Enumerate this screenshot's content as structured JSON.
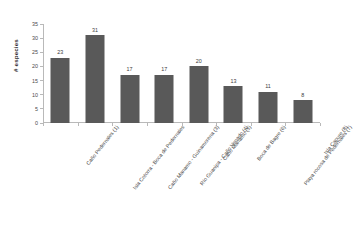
{
  "chart_data": {
    "type": "bar",
    "title": "",
    "subtitle": "",
    "xlabel": "",
    "ylabel": "# especies",
    "ylim": [
      0,
      35
    ],
    "ytick_values": [
      0,
      5,
      10,
      15,
      20,
      25,
      30,
      35
    ],
    "ytick_labels": [
      "0",
      "5",
      "10",
      "15",
      "20",
      "25",
      "30",
      "35"
    ],
    "grid": false,
    "legend": null,
    "bar_color": "#595959",
    "axis_color": "#b9b9b9",
    "data_labels_shown": true,
    "categories": [
      "Caño Pedernales (1)",
      "Isla Cotorra - Boca de Pedernales",
      "Caño Manamo - Guinamorena (3)",
      "Río Guanipa - Caño Venado (4)",
      "Caño Manamo (5)",
      "Boca de Bagre (6)",
      "Playa rocosa de Pedernales (7)",
      "Isla Capure (8)"
    ],
    "values": [
      23,
      31,
      17,
      17,
      20,
      13,
      11,
      8
    ],
    "value_labels": [
      "23",
      "31",
      "17",
      "17",
      "20",
      "13",
      "11",
      "8"
    ]
  }
}
